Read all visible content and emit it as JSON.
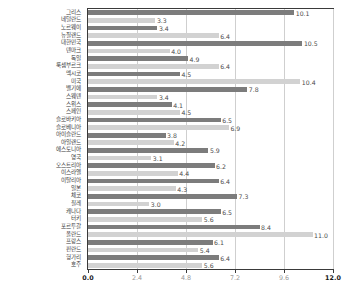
{
  "chart_data": {
    "type": "bar",
    "orientation": "horizontal",
    "title": "",
    "subtitle": "",
    "xlabel": "",
    "ylabel": "",
    "xlim": [
      0.0,
      12.0
    ],
    "xticks": [
      "0.0",
      "2.4",
      "4.8",
      "7.2",
      "9.6",
      "12.0"
    ],
    "xtick_values": [
      0.0,
      2.4,
      4.8,
      7.2,
      9.6,
      12.0
    ],
    "grid": true,
    "legend": null,
    "categories": [
      "그리스",
      "네덜란드",
      "노르웨이",
      "뉴질랜드",
      "대한민국",
      "덴마크",
      "독일",
      "룩셈부르크",
      "멕시코",
      "미국",
      "벨기에",
      "스웨덴",
      "스위스",
      "스페인",
      "슬로바키아",
      "슬로베니아",
      "아이슬란드",
      "아일랜드",
      "에스토니아",
      "영국",
      "오스트리아",
      "이스라엘",
      "이탈리아",
      "일본",
      "체코",
      "칠레",
      "캐나다",
      "터키",
      "포르투갈",
      "폴란드",
      "프랑스",
      "핀란드",
      "헝가리",
      "호주"
    ],
    "values": [
      10.1,
      3.3,
      3.4,
      6.4,
      10.5,
      4.0,
      4.9,
      6.4,
      4.5,
      10.4,
      7.8,
      3.4,
      4.1,
      4.5,
      6.5,
      6.9,
      3.8,
      4.2,
      5.9,
      3.1,
      6.2,
      4.4,
      6.4,
      4.3,
      7.3,
      3.0,
      6.5,
      5.6,
      8.4,
      11.0,
      6.1,
      5.4,
      6.4,
      5.6
    ],
    "value_labels": [
      "10.1",
      "3.3",
      "3.4",
      "6.4",
      "10.5",
      "4.0",
      "4.9",
      "6.4",
      "4.5",
      "10.4",
      "7.8",
      "3.4",
      "4.1",
      "4.5",
      "6.5",
      "6.9",
      "3.8",
      "4.2",
      "5.9",
      "3.1",
      "6.2",
      "4.4",
      "6.4",
      "4.3",
      "7.3",
      "3.0",
      "6.5",
      "5.6",
      "8.4",
      "11.0",
      "6.1",
      "5.4",
      "6.4",
      "5.6"
    ],
    "bar_colors": [
      "#7c7c7c",
      "#d2d2d2"
    ],
    "axis_color": "#3a3a3a",
    "grid_color": "#cfcfcf",
    "label_color": "#3d3d3d",
    "value_color": "#4a4a4a"
  }
}
